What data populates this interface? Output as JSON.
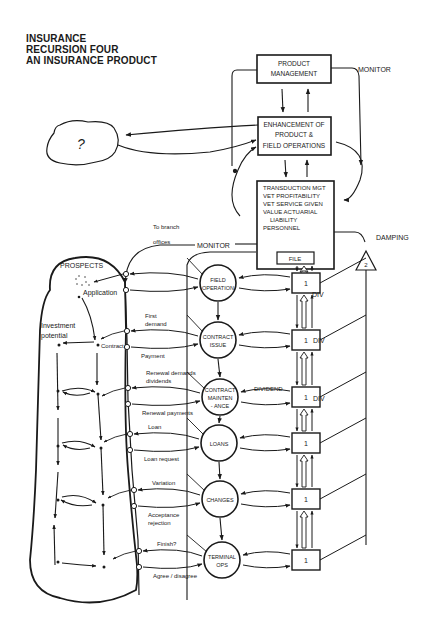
{
  "title": {
    "line1": "INSURANCE",
    "line2": "RECURSION FOUR",
    "line3": "AN INSURANCE PRODUCT"
  },
  "boxes": {
    "product_management": [
      "PRODUCT",
      "MANAGEMENT"
    ],
    "enhancement": [
      "ENHANCEMENT OF",
      "PRODUCT &",
      "FIELD OPERATIONS"
    ],
    "transduction": [
      "TRANSDUCTION MGT",
      "VET PROFITABILITY",
      "VET SERVICE GIVEN",
      "VALUE ACTUARIAL",
      "LIABILITY",
      "PERSONNEL"
    ],
    "file": "FILE"
  },
  "cloud_label": "?",
  "labels": {
    "monitor_top": "MONITOR",
    "monitor_mid": "MONITOR",
    "to_branch_1": "To branch",
    "to_branch_2": "offices",
    "damping": "DAMPING",
    "damping_number": "2",
    "div1": "DIV",
    "div2": "DIV",
    "div3": "DIV",
    "dividend": "DIVIDEND",
    "prospects": "PROSPECTS",
    "application": "Application",
    "investment_1": "Investment",
    "investment_2": "potential",
    "contract": "Contract"
  },
  "operations": [
    {
      "id": "field-operation",
      "lines": [
        "FIELD",
        "OPERATION"
      ],
      "in_label": [],
      "out_label": []
    },
    {
      "id": "contract-issue",
      "lines": [
        "CONTRACT",
        "ISSUE"
      ],
      "in_label": [
        "First",
        "demand"
      ],
      "out_label": [
        "Payment"
      ]
    },
    {
      "id": "contract-maintenance",
      "lines": [
        "CONTRACT",
        "MAINTEN",
        "- ANCE"
      ],
      "in_label": [
        "Renewal demands",
        "dividends"
      ],
      "out_label": [
        "Renewal payments"
      ]
    },
    {
      "id": "loans",
      "lines": [
        "LOANS"
      ],
      "in_label": [
        "Loan"
      ],
      "out_label": [
        "Loan request"
      ]
    },
    {
      "id": "changes",
      "lines": [
        "CHANGES"
      ],
      "in_label": [
        "Variation"
      ],
      "out_label": [
        "Acceptance",
        "rejection"
      ]
    },
    {
      "id": "terminal-ops",
      "lines": [
        "TERMINAL",
        "OPS"
      ],
      "in_label": [
        "Finish?"
      ],
      "out_label": [
        "Agree / disagree"
      ]
    }
  ],
  "regulators": [
    "1",
    "1",
    "1",
    "1",
    "1",
    "1"
  ]
}
